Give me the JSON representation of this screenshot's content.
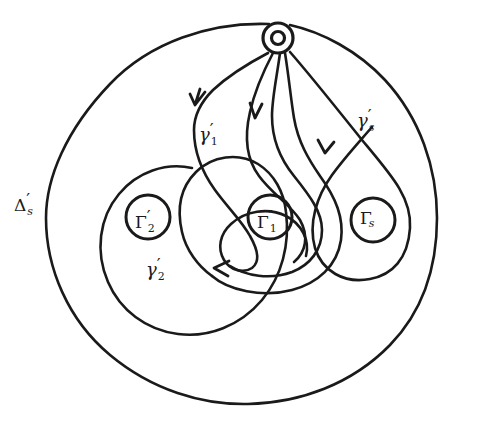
{
  "figure": {
    "kind": "topological-diagram",
    "background_color": "#ffffff",
    "ink_color": "#1a1a1a"
  },
  "labels": {
    "domain": {
      "id": "delta-prime-s",
      "base": "Δ",
      "prime": "′",
      "sub": "s",
      "x": 14,
      "y": 191
    },
    "holes": [
      {
        "id": "gamma-cap-prime-2",
        "base": "Γ",
        "prime": "′",
        "sub": "2",
        "sub_style": "number",
        "cx": 148,
        "cy": 217,
        "r": 22
      },
      {
        "id": "gamma-cap-prime-1",
        "base": "Γ",
        "prime": "′",
        "sub": "1",
        "sub_style": "number",
        "cx": 270,
        "cy": 217,
        "r": 22
      },
      {
        "id": "gamma-cap-s",
        "base": "Γ",
        "prime": "",
        "sub": "s",
        "sub_style": "italic",
        "cx": 373,
        "cy": 220,
        "r": 22
      }
    ],
    "loops": [
      {
        "id": "gamma-prime-1",
        "base": "γ",
        "prime": "′",
        "sub": "1",
        "sub_style": "number",
        "x": 199,
        "y": 121
      },
      {
        "id": "gamma-prime-s",
        "base": "γ",
        "prime": "′",
        "sub": "s",
        "sub_style": "italic",
        "x": 357,
        "y": 107
      },
      {
        "id": "gamma-prime-2",
        "base": "γ",
        "prime": "′",
        "sub": "2",
        "sub_style": "number",
        "x": 146,
        "y": 256
      }
    ]
  },
  "basepoint": {
    "id": "basepoint-annulus",
    "cx": 278,
    "cy": 38,
    "outer_r": 15,
    "inner_r": 6.5
  },
  "outer_boundary": {
    "id": "delta-prime-s-boundary",
    "cx": 241,
    "cy": 215,
    "rx": 196,
    "ry": 192
  },
  "arrows": [
    {
      "id": "arrow-gamma-1",
      "x": 196,
      "y": 104,
      "angle": 205
    },
    {
      "id": "arrow-middle",
      "x": 256,
      "y": 117,
      "angle": 265
    },
    {
      "id": "arrow-gamma-s",
      "x": 326,
      "y": 152,
      "angle": 280
    },
    {
      "id": "arrow-gamma-2",
      "x": 217,
      "y": 268,
      "angle": 178
    }
  ],
  "curve_count": 6
}
